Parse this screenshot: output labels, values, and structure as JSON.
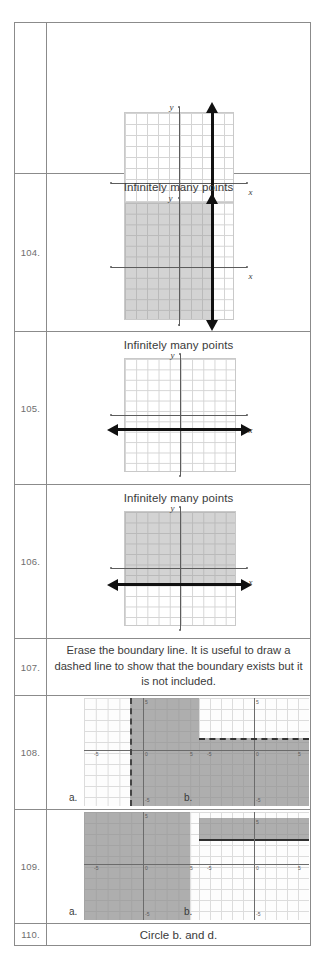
{
  "document": {
    "kind": "math-worksheet-answer-key",
    "page_background": "#ffffff",
    "table_border_color": "#8b8b8b",
    "text_color": "#3a3a3a",
    "shade_color": "#969696",
    "line_color": "#111111"
  },
  "rows": [
    {
      "number": "",
      "caption": "",
      "graph": {
        "type": "coordinate-plane",
        "solution": "vertical-line",
        "shaded": "none",
        "x_axis_label": "x",
        "y_axis_label": "y"
      }
    },
    {
      "number": "104.",
      "caption": "Infinitely many points",
      "graph": {
        "type": "coordinate-plane",
        "solution": "vertical-line",
        "shaded": "left-of-line",
        "x_axis_label": "x",
        "y_axis_label": "y"
      }
    },
    {
      "number": "105.",
      "caption": "Infinitely many points",
      "graph": {
        "type": "coordinate-plane",
        "solution": "horizontal-line",
        "shaded": "none",
        "x_axis_label": "x",
        "y_axis_label": "y"
      }
    },
    {
      "number": "106.",
      "caption": "Infinitely many points",
      "graph": {
        "type": "coordinate-plane",
        "solution": "horizontal-line",
        "shaded": "above-line",
        "x_axis_label": "x",
        "y_axis_label": "y"
      }
    },
    {
      "number": "107.",
      "caption": "Erase the boundary line.  It is useful to draw a dashed line to show that the boundary exists but it is not included.",
      "graph": null
    },
    {
      "number": "108.",
      "label_a": "a.",
      "label_b": "b.",
      "graph_a": {
        "type": "calculator-plot",
        "boundary": "dashed-vertical",
        "shaded": "right-of-boundary",
        "tick_labels": [
          "-5",
          "0",
          "5",
          "5",
          "-5"
        ]
      },
      "graph_b": {
        "type": "calculator-plot",
        "boundary": "dashed-horizontal",
        "shaded": "below-boundary",
        "tick_labels": [
          "-5",
          "0",
          "5",
          "5",
          "-5"
        ]
      }
    },
    {
      "number": "109.",
      "label_a": "a.",
      "label_b": "b.",
      "graph_a": {
        "type": "calculator-plot",
        "boundary": "none",
        "shaded": "full-region-left",
        "tick_labels": [
          "-5",
          "0",
          "5",
          "5",
          "-5"
        ]
      },
      "graph_b": {
        "type": "calculator-plot",
        "boundary": "solid-horizontal",
        "shaded": "band-above-axis",
        "tick_labels": [
          "-5",
          "0",
          "5",
          "5",
          "-5"
        ]
      }
    },
    {
      "number": "110.",
      "caption": "Circle b. and d.",
      "graph": null
    }
  ],
  "mini_tick_labels": {
    "left": "-5",
    "center": "0",
    "right": "5",
    "top": "5",
    "bottom": "-5"
  }
}
